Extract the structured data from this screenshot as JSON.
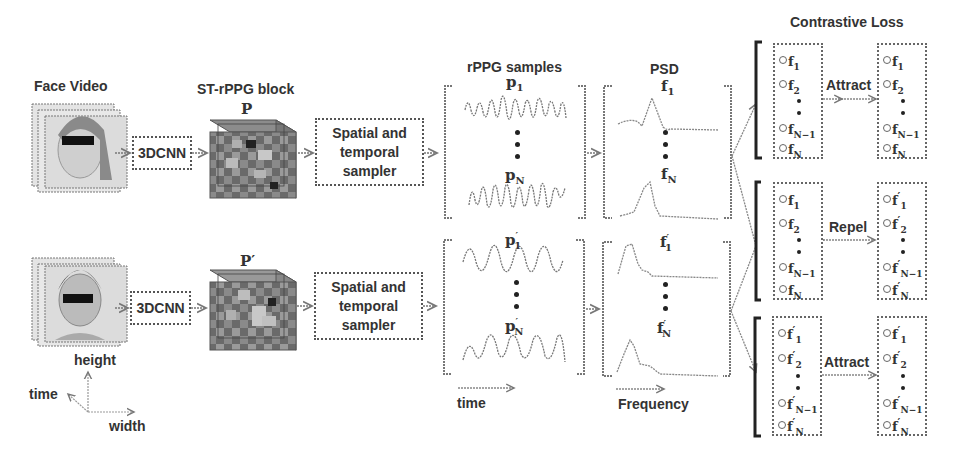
{
  "titles": {
    "face_video": "Face Video",
    "st_block": "ST-rPPG block",
    "rppg_samples": "rPPG samples",
    "psd": "PSD",
    "contrastive_loss": "Contrastive Loss"
  },
  "pipeline": {
    "cnn_top": "3DCNN",
    "cnn_bottom": "3DCNN",
    "sampler_top_l1": "Spatial and",
    "sampler_top_l2": "temporal",
    "sampler_top_l3": "sampler",
    "sampler_bottom_l1": "Spatial and",
    "sampler_bottom_l2": "temporal",
    "sampler_bottom_l3": "sampler",
    "block_top_label": "P",
    "block_bottom_label": "P′"
  },
  "samples": {
    "top_first": {
      "base": "p",
      "sub": "1",
      "prime": ""
    },
    "top_last": {
      "base": "p",
      "sub": "N",
      "prime": ""
    },
    "bottom_first": {
      "base": "p",
      "sub": "1",
      "prime": "′"
    },
    "bottom_last": {
      "base": "p",
      "sub": "N",
      "prime": "′"
    },
    "axis_label": "time"
  },
  "psd": {
    "top_first": {
      "base": "f",
      "sub": "1",
      "prime": ""
    },
    "top_last": {
      "base": "f",
      "sub": "N",
      "prime": ""
    },
    "bottom_first": {
      "base": "f",
      "sub": "1",
      "prime": "′"
    },
    "bottom_last": {
      "base": "f",
      "sub": "N",
      "prime": "′"
    },
    "axis_label": "Frequency"
  },
  "axes": {
    "height": "height",
    "time": "time",
    "width": "width"
  },
  "contrastive": {
    "groups": [
      {
        "relation": "Attract",
        "left": [
          {
            "b": "f",
            "s": "1",
            "p": ""
          },
          {
            "b": "f",
            "s": "2",
            "p": ""
          },
          {
            "b": "f",
            "s": "N−1",
            "p": ""
          },
          {
            "b": "f",
            "s": "N",
            "p": ""
          }
        ],
        "right": [
          {
            "b": "f",
            "s": "1",
            "p": ""
          },
          {
            "b": "f",
            "s": "2",
            "p": ""
          },
          {
            "b": "f",
            "s": "N−1",
            "p": ""
          },
          {
            "b": "f",
            "s": "N",
            "p": ""
          }
        ]
      },
      {
        "relation": "Repel",
        "left": [
          {
            "b": "f",
            "s": "1",
            "p": ""
          },
          {
            "b": "f",
            "s": "2",
            "p": ""
          },
          {
            "b": "f",
            "s": "N−1",
            "p": ""
          },
          {
            "b": "f",
            "s": "N",
            "p": ""
          }
        ],
        "right": [
          {
            "b": "f",
            "s": "1",
            "p": "′"
          },
          {
            "b": "f",
            "s": "2",
            "p": "′"
          },
          {
            "b": "f",
            "s": "N−1",
            "p": "′"
          },
          {
            "b": "f",
            "s": "N",
            "p": "′"
          }
        ]
      },
      {
        "relation": "Attract",
        "left": [
          {
            "b": "f",
            "s": "1",
            "p": "′"
          },
          {
            "b": "f",
            "s": "2",
            "p": "′"
          },
          {
            "b": "f",
            "s": "N−1",
            "p": "′"
          },
          {
            "b": "f",
            "s": "N",
            "p": "′"
          }
        ],
        "right": [
          {
            "b": "f",
            "s": "1",
            "p": "′"
          },
          {
            "b": "f",
            "s": "2",
            "p": "′"
          },
          {
            "b": "f",
            "s": "N−1",
            "p": "′"
          },
          {
            "b": "f",
            "s": "N",
            "p": "′"
          }
        ]
      }
    ]
  },
  "colors": {
    "line": "#666666",
    "text": "#333333",
    "cube_dark": "#555555",
    "cube_light": "#aaaaaa",
    "face_bg": "#d8d8d8"
  }
}
